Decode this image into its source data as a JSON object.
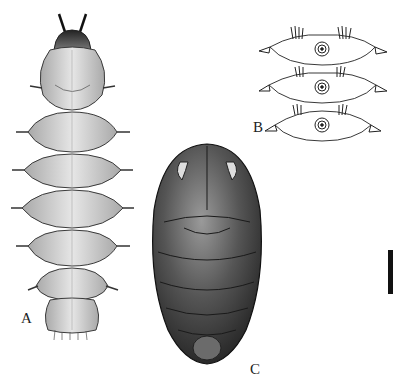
{
  "plate": {
    "figures": [
      {
        "id": "A",
        "label": "A",
        "subject": "larva, dorsal view"
      },
      {
        "id": "B",
        "label": "B",
        "subject": "body segments detail with spiracles"
      },
      {
        "id": "C",
        "label": "C",
        "subject": "pupa, dorsal view"
      }
    ],
    "scale_bar": {
      "orientation": "vertical"
    }
  },
  "colors": {
    "background": "#ffffff",
    "larva_fill": "#cfcfcf",
    "larva_outline": "#3a3a3a",
    "pupa_fill": "#4a4a4a",
    "pupa_highlight": "#9a9a9a",
    "ink": "#111111"
  }
}
